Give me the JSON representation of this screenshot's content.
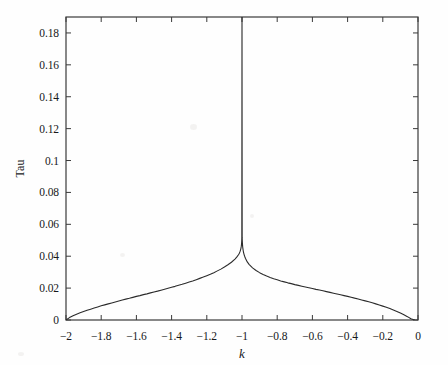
{
  "chart_data": {
    "type": "line",
    "title": "",
    "xlabel": "k",
    "ylabel": "Tau",
    "xlim": [
      -2,
      0
    ],
    "ylim": [
      0,
      0.19
    ],
    "grid": false,
    "legend": false,
    "line_color": "#2b2b2b",
    "xticks": [
      -2,
      -1.8,
      -1.6,
      -1.4,
      -1.2,
      -1,
      -0.8,
      -0.6,
      -0.4,
      -0.2,
      0
    ],
    "xtick_labels": [
      "−2",
      "−1.8",
      "−1.6",
      "−1.4",
      "−1.2",
      "−1",
      "−0.8",
      "−0.6",
      "−0.4",
      "−0.2",
      "0"
    ],
    "yticks": [
      0,
      0.02,
      0.04,
      0.06,
      0.08,
      0.1,
      0.12,
      0.14,
      0.16,
      0.18
    ],
    "ytick_labels": [
      "0",
      "0.02",
      "0.04",
      "0.06",
      "0.08",
      "0.1",
      "0.12",
      "0.14",
      "0.16",
      "0.18"
    ],
    "annotation": "Symmetric cusp singularity peaking at k = -1, clipped at top of axes",
    "peak_x": -1,
    "peak_y_clipped": 0.19,
    "x": [
      -2,
      -1.98,
      -1.96,
      -1.94,
      -1.92,
      -1.9,
      -1.88,
      -1.86,
      -1.84,
      -1.82,
      -1.8,
      -1.78,
      -1.76,
      -1.74,
      -1.72,
      -1.7,
      -1.68,
      -1.66,
      -1.64,
      -1.62,
      -1.6,
      -1.58,
      -1.56,
      -1.54,
      -1.52,
      -1.5,
      -1.48,
      -1.46,
      -1.44,
      -1.42,
      -1.4,
      -1.38,
      -1.36,
      -1.34,
      -1.32,
      -1.3,
      -1.28,
      -1.26,
      -1.24,
      -1.22,
      -1.2,
      -1.18,
      -1.16,
      -1.14,
      -1.12,
      -1.1,
      -1.08,
      -1.06,
      -1.04,
      -1.03,
      -1.02,
      -1.015,
      -1.012,
      -1.009,
      -1.007,
      -1.005,
      -1.004,
      -1.003,
      -1.0025,
      -1.002,
      -1.0016,
      -1.0013,
      -1.001,
      -1,
      -0.999,
      -0.9987,
      -0.9984,
      -0.998,
      -0.9975,
      -0.997,
      -0.996,
      -0.995,
      -0.993,
      -0.991,
      -0.988,
      -0.985,
      -0.98,
      -0.97,
      -0.96,
      -0.94,
      -0.92,
      -0.9,
      -0.88,
      -0.86,
      -0.84,
      -0.82,
      -0.8,
      -0.78,
      -0.76,
      -0.74,
      -0.72,
      -0.7,
      -0.68,
      -0.66,
      -0.64,
      -0.62,
      -0.6,
      -0.58,
      -0.56,
      -0.54,
      -0.52,
      -0.5,
      -0.48,
      -0.46,
      -0.44,
      -0.42,
      -0.4,
      -0.38,
      -0.36,
      -0.34,
      -0.32,
      -0.3,
      -0.28,
      -0.26,
      -0.24,
      -0.22,
      -0.2,
      -0.18,
      -0.16,
      -0.14,
      -0.12,
      -0.1,
      -0.08,
      -0.06,
      -0.04,
      -0.02,
      0
    ],
    "y": [
      0,
      0.0015,
      0.0026,
      0.0036,
      0.0045,
      0.0053,
      0.0061,
      0.0068,
      0.0075,
      0.0082,
      0.0089,
      0.0095,
      0.0101,
      0.0107,
      0.0113,
      0.0119,
      0.0125,
      0.0131,
      0.0136,
      0.0142,
      0.0148,
      0.0153,
      0.0159,
      0.0164,
      0.017,
      0.0176,
      0.0181,
      0.0187,
      0.0193,
      0.0199,
      0.0205,
      0.0211,
      0.0218,
      0.0224,
      0.0231,
      0.0238,
      0.0245,
      0.0253,
      0.0261,
      0.0269,
      0.0278,
      0.0287,
      0.0297,
      0.0308,
      0.0319,
      0.0332,
      0.0346,
      0.0362,
      0.0382,
      0.0394,
      0.0409,
      0.0419,
      0.0427,
      0.0437,
      0.0445,
      0.0456,
      0.0463,
      0.0472,
      0.0479,
      0.0487,
      0.0495,
      0.0505,
      0.0518,
      0.19,
      0.0518,
      0.0507,
      0.0498,
      0.0489,
      0.0479,
      0.0471,
      0.0458,
      0.0449,
      0.0434,
      0.0423,
      0.041,
      0.04,
      0.0386,
      0.0364,
      0.0349,
      0.0327,
      0.031,
      0.0297,
      0.0286,
      0.0276,
      0.0267,
      0.0259,
      0.0252,
      0.0245,
      0.0239,
      0.0233,
      0.0228,
      0.0222,
      0.0217,
      0.0212,
      0.0207,
      0.0202,
      0.0197,
      0.0192,
      0.0188,
      0.0183,
      0.0178,
      0.0173,
      0.0168,
      0.0163,
      0.0158,
      0.0153,
      0.0148,
      0.0143,
      0.0137,
      0.0132,
      0.0126,
      0.012,
      0.0114,
      0.0108,
      0.0101,
      0.0094,
      0.0087,
      0.008,
      0.0072,
      0.0063,
      0.0054,
      0.0044,
      0.0033,
      0.0021,
      0.0008,
      0
    ]
  },
  "axes_geometry": {
    "left": 66,
    "right": 418,
    "top": 17,
    "bottom": 320
  }
}
